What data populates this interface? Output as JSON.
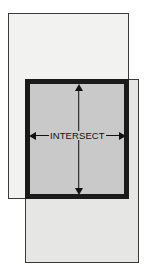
{
  "diagram": {
    "type": "set-intersection-venn",
    "title": "",
    "canvas": {
      "width": 146,
      "height": 277,
      "background": "#ffffff"
    },
    "labels": {
      "intersect": "INTERSECT"
    },
    "shapes": [
      {
        "name": "rect-a",
        "role": "first-set-rectangle",
        "x": 8,
        "y": 13,
        "width": 121,
        "height": 186,
        "fill": "#f2f2f0",
        "stroke": "#3a3a3a",
        "stroke_width": 1.5
      },
      {
        "name": "rect-b",
        "role": "second-set-rectangle",
        "x": 25,
        "y": 79,
        "width": 114,
        "height": 184,
        "fill": "#e6e6e4",
        "stroke": "#3a3a3a",
        "stroke_width": 1.5
      },
      {
        "name": "intersect-region",
        "role": "overlap-region",
        "x": 25,
        "y": 79,
        "width": 104,
        "height": 120,
        "fill": "#c9c9c9",
        "stroke": "#1a1a1a",
        "stroke_width": 5
      }
    ],
    "annotations": [
      {
        "name": "horizontal-dimension-arrow",
        "orientation": "horizontal",
        "double_headed": true,
        "label": "INTERSECT",
        "x": 29,
        "y": 129,
        "length": 96,
        "color": "#111111"
      },
      {
        "name": "vertical-dimension-arrow",
        "orientation": "vertical",
        "double_headed": true,
        "label": "",
        "x": 78,
        "y": 84,
        "length": 111,
        "color": "#111111"
      }
    ],
    "colors": {
      "set_a_fill": "#f2f2f0",
      "set_b_fill": "#e6e6e4",
      "intersect_fill": "#c9c9c9",
      "thin_stroke": "#3a3a3a",
      "thick_stroke": "#1a1a1a",
      "arrow": "#111111",
      "background": "#ffffff"
    }
  }
}
